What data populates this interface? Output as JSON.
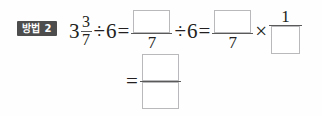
{
  "worksheet": {
    "label": "worksheet-problem",
    "background_color": "#fefefe",
    "ink_color": "#231f20",
    "box_border_color": "#b9b9bb"
  },
  "badge": {
    "text": "방법 2",
    "background_color": "#4d4d4d",
    "text_color": "#ffffff"
  },
  "equation": {
    "line1": {
      "mixed_number": {
        "whole": "3",
        "numerator": "3",
        "denominator": "7"
      },
      "divide_sign_1": "÷",
      "divisor_1": "6",
      "equals_1": "=",
      "fraction_1": {
        "numerator": "",
        "denominator": "7"
      },
      "divide_sign_2": "÷",
      "divisor_2": "6",
      "equals_2": "=",
      "fraction_2": {
        "numerator": "",
        "denominator": "7"
      },
      "multiply_sign": "×",
      "fraction_3": {
        "numerator": "1",
        "denominator": ""
      }
    },
    "line2": {
      "equals": "=",
      "fraction_result": {
        "numerator": "",
        "denominator": ""
      }
    }
  }
}
